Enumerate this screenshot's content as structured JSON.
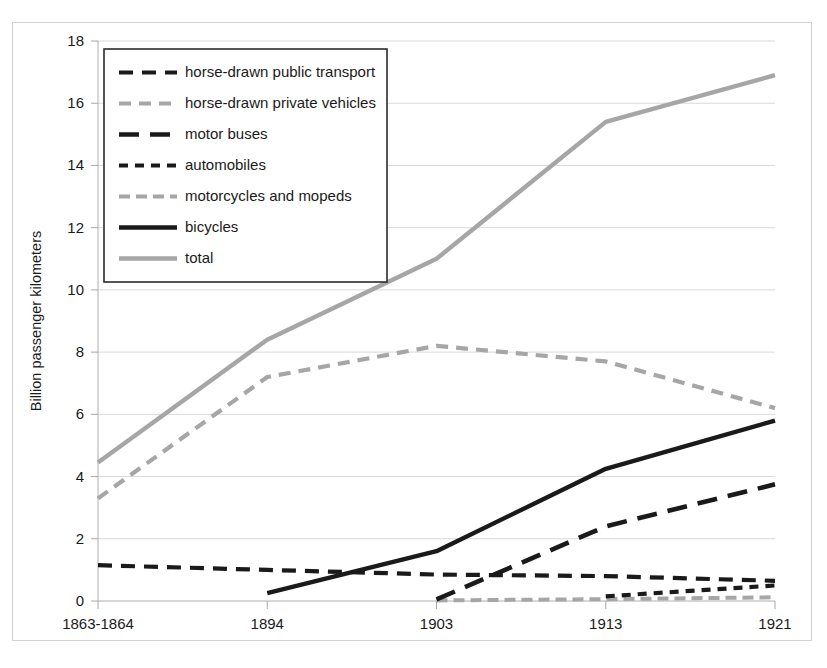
{
  "chart_data": {
    "type": "line",
    "title": "",
    "xlabel": "",
    "ylabel": "Billion passenger kilometers",
    "categories": [
      "1863-1864",
      "1894",
      "1903",
      "1913",
      "1921"
    ],
    "ylim": [
      0,
      18
    ],
    "ytick_step": 2,
    "yticks": [
      "0",
      "2",
      "4",
      "6",
      "8",
      "10",
      "12",
      "14",
      "16",
      "18"
    ],
    "grid": true,
    "legend_position": "upper-left",
    "series": [
      {
        "name": "horse-drawn public transport",
        "style": "dashed",
        "color": "#1a1a1a",
        "dash": "14,9",
        "width": 4.2,
        "values": [
          1.15,
          1.0,
          0.85,
          0.8,
          0.65
        ]
      },
      {
        "name": "horse-drawn private vehicles",
        "style": "dashed",
        "color": "#a6a6a6",
        "dash": "12,8",
        "width": 4.2,
        "values": [
          3.3,
          7.2,
          8.2,
          7.7,
          6.2
        ]
      },
      {
        "name": "motor buses",
        "style": "dashed",
        "color": "#1a1a1a",
        "dash": "20,11",
        "width": 4.6,
        "values": [
          null,
          null,
          0.05,
          2.4,
          3.75
        ]
      },
      {
        "name": "automobiles",
        "style": "dashed",
        "color": "#1a1a1a",
        "dash": "9,7",
        "width": 4.2,
        "values": [
          null,
          null,
          null,
          0.15,
          0.5
        ]
      },
      {
        "name": "motorcycles and mopeds",
        "style": "dotted",
        "color": "#a6a6a6",
        "dash": "11,6",
        "width": 4.0,
        "values": [
          null,
          null,
          0.02,
          0.06,
          0.12
        ]
      },
      {
        "name": "bicycles",
        "style": "solid",
        "color": "#1a1a1a",
        "dash": "",
        "width": 4.4,
        "values": [
          null,
          0.25,
          1.6,
          4.25,
          5.8
        ]
      },
      {
        "name": "total",
        "style": "solid",
        "color": "#a6a6a6",
        "dash": "",
        "width": 4.4,
        "values": [
          4.45,
          8.4,
          11.0,
          15.4,
          16.9
        ]
      }
    ]
  },
  "legend": {
    "entries": [
      "horse-drawn public transport",
      "horse-drawn private vehicles",
      "motor buses",
      "automobiles",
      "motorcycles and mopeds",
      "bicycles",
      "total"
    ]
  }
}
